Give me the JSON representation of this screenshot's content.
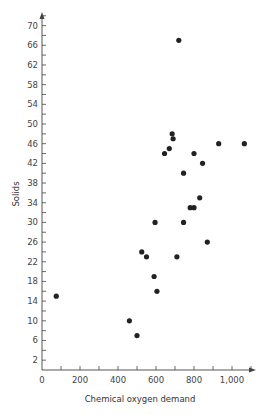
{
  "chart_data": {
    "type": "scatter",
    "title": "",
    "xlabel": "Chemical oxygen demand",
    "ylabel": "Solids",
    "xlim": [
      0,
      1100
    ],
    "ylim": [
      0,
      72
    ],
    "x_ticks": [
      0,
      200,
      400,
      600,
      800,
      1000
    ],
    "x_tick_labels": [
      "0",
      "200",
      "400",
      "600",
      "800",
      "1,000"
    ],
    "x_minor_step": 100,
    "y_ticks": [
      2,
      6,
      10,
      14,
      18,
      22,
      26,
      30,
      34,
      38,
      42,
      46,
      50,
      54,
      58,
      62,
      66,
      70
    ],
    "y_tick_labels": [
      "2",
      "6",
      "10",
      "14",
      "18",
      "22",
      "26",
      "30",
      "34",
      "38",
      "42",
      "46",
      "50",
      "54",
      "58",
      "62",
      "66",
      "70"
    ],
    "y_minor_step": 2,
    "grid": false,
    "legend": null,
    "marker_color": "#222222",
    "points": [
      {
        "x": 720,
        "y": 67
      },
      {
        "x": 685,
        "y": 48
      },
      {
        "x": 690,
        "y": 47
      },
      {
        "x": 670,
        "y": 45
      },
      {
        "x": 645,
        "y": 44
      },
      {
        "x": 800,
        "y": 44
      },
      {
        "x": 845,
        "y": 42
      },
      {
        "x": 745,
        "y": 40
      },
      {
        "x": 930,
        "y": 46
      },
      {
        "x": 1065,
        "y": 46
      },
      {
        "x": 830,
        "y": 35
      },
      {
        "x": 780,
        "y": 33
      },
      {
        "x": 800,
        "y": 33
      },
      {
        "x": 595,
        "y": 30
      },
      {
        "x": 745,
        "y": 30
      },
      {
        "x": 870,
        "y": 26
      },
      {
        "x": 525,
        "y": 24
      },
      {
        "x": 550,
        "y": 23
      },
      {
        "x": 710,
        "y": 23
      },
      {
        "x": 590,
        "y": 19
      },
      {
        "x": 605,
        "y": 16
      },
      {
        "x": 75,
        "y": 15
      },
      {
        "x": 460,
        "y": 10
      },
      {
        "x": 500,
        "y": 7
      }
    ]
  }
}
